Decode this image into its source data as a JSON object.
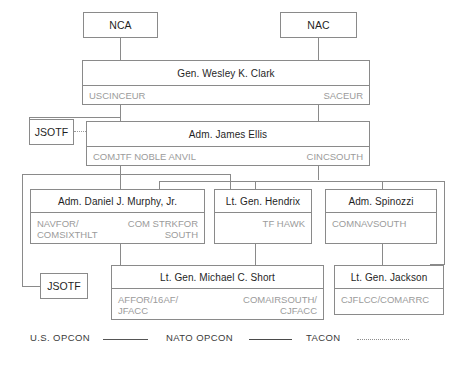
{
  "diagram": {
    "colors": {
      "border": "#8a8a8a",
      "title_text": "#1f1f1f",
      "subtitle_text": "#9b9b9b",
      "legend_text": "#3a3a3a",
      "background": "#ffffff"
    },
    "nodes": {
      "nca": {
        "title": "NCA"
      },
      "nac": {
        "title": "NAC"
      },
      "clark": {
        "title": "Gen. Wesley K. Clark",
        "role_left": "USCINCEUR",
        "role_right": "SACEUR"
      },
      "jsotf_top": {
        "title": "JSOTF"
      },
      "ellis": {
        "title": "Adm. James Ellis",
        "role_left": "COMJTF NOBLE ANVIL",
        "role_right": "CINCSOUTH"
      },
      "murphy": {
        "title": "Adm. Daniel J. Murphy, Jr.",
        "role_left": "NAVFOR/\nCOMSIXTHLT",
        "role_right": "COM STRKFOR\nSOUTH"
      },
      "hendrix": {
        "title": "Lt. Gen. Hendrix",
        "role_right": "TF HAWK"
      },
      "spinozzi": {
        "title": "Adm. Spinozzi",
        "role_left": "COMNAVSOUTH"
      },
      "jsotf_bottom": {
        "title": "JSOTF"
      },
      "short": {
        "title": "Lt. Gen. Michael C. Short",
        "role_left": "AFFOR/16AF/\nJFACC",
        "role_right": "COMAIRSOUTH/\nCJFACC"
      },
      "jackson": {
        "title": "Lt. Gen. Jackson",
        "role_left": "CJFLCC/COMARRC"
      }
    },
    "legend": {
      "items": [
        {
          "label": "U.S. OPCON",
          "line_style": "solid"
        },
        {
          "label": "NATO OPCON",
          "line_style": "solid"
        },
        {
          "label": "TACON",
          "line_style": "dotted"
        }
      ]
    }
  }
}
